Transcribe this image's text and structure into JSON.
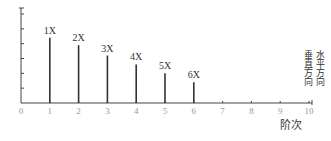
{
  "chart_data": {
    "type": "bar",
    "title": "",
    "xlabel": "阶次",
    "ylabel": "",
    "categories": [
      "1",
      "2",
      "3",
      "4",
      "5",
      "6"
    ],
    "x_ticks": [
      "0",
      "1",
      "2",
      "3",
      "4",
      "5",
      "6",
      "7",
      "8",
      "9",
      "10"
    ],
    "xlim": [
      0,
      10
    ],
    "ylim": [
      0,
      6.4
    ],
    "y_ticks_count": 6,
    "grid": false,
    "series": [
      {
        "name": "order amplitude",
        "bar_labels": [
          "1X",
          "2X",
          "3X",
          "4X",
          "5X",
          "6X"
        ],
        "x": [
          1,
          2,
          3,
          4,
          5,
          6
        ],
        "values": [
          4.4,
          3.9,
          3.2,
          2.6,
          2.0,
          1.4
        ]
      }
    ],
    "legend": {
      "position": "right",
      "entries": [
        "垂直方向",
        "水平方向"
      ]
    },
    "colors": {
      "axis": "#444444",
      "bar": "#333333",
      "tick_label": "#999999",
      "text": "#333333"
    }
  }
}
